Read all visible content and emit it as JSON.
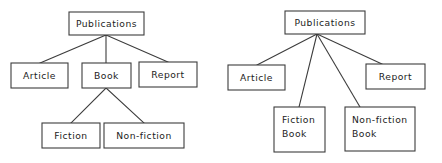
{
  "figure": {
    "background_color": "#ffffff",
    "line_color": "#3c3c3c",
    "text_color": "#1c1c1c"
  },
  "diagrams": [
    {
      "id": "left-diagram",
      "name": "nested-hierarchy-diagram",
      "root": {
        "label": "Publications"
      },
      "level2": [
        {
          "label": "Article"
        },
        {
          "label": "Book"
        },
        {
          "label": "Report"
        }
      ],
      "level3": [
        {
          "label": "Fiction"
        },
        {
          "label": "Non-fiction"
        }
      ],
      "edges": [
        {
          "from": "Publications",
          "to": "Article"
        },
        {
          "from": "Publications",
          "to": "Book"
        },
        {
          "from": "Publications",
          "to": "Report"
        },
        {
          "from": "Book",
          "to": "Fiction"
        },
        {
          "from": "Book",
          "to": "Non-fiction"
        }
      ]
    },
    {
      "id": "right-diagram",
      "name": "flat-hierarchy-diagram",
      "root": {
        "label": "Publications"
      },
      "level2": [
        {
          "label": "Article"
        },
        {
          "label_line1": "Fiction",
          "label_line2": "Book"
        },
        {
          "label_line1": "Non-fiction",
          "label_line2": "Book"
        },
        {
          "label": "Report"
        }
      ],
      "edges": [
        {
          "from": "Publications",
          "to": "Article"
        },
        {
          "from": "Publications",
          "to": "Fiction Book"
        },
        {
          "from": "Publications",
          "to": "Non-fiction Book"
        },
        {
          "from": "Publications",
          "to": "Report"
        }
      ]
    }
  ]
}
